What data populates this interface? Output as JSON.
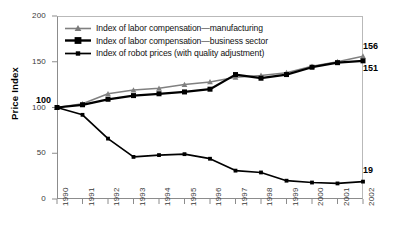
{
  "chart_data": {
    "type": "line",
    "title": "",
    "xlabel": "",
    "ylabel": "Price Index",
    "categories": [
      "1990",
      "1991",
      "1992",
      "1993",
      "1994",
      "1995",
      "1996",
      "1997",
      "1998",
      "1999",
      "2000",
      "2001",
      "2002"
    ],
    "ylim": [
      0,
      200
    ],
    "yticks": [
      0,
      50,
      100,
      150,
      200
    ],
    "grid": false,
    "legend_position": "top-left",
    "series": [
      {
        "name": "Index of labor compensation—manufacturing",
        "color": "#808080",
        "marker": "triangle",
        "values": [
          100,
          104,
          115,
          119,
          121,
          125,
          128,
          133,
          135,
          138,
          145,
          150,
          156
        ]
      },
      {
        "name": "Index of labor compensation—business sector",
        "color": "#000000",
        "marker": "square",
        "values": [
          100,
          103,
          109,
          113,
          115,
          117,
          120,
          136,
          132,
          136,
          144,
          149,
          151
        ]
      },
      {
        "name": "Index of robot prices (with quality adjustment)",
        "color": "#000000",
        "marker": "square-small",
        "values": [
          100,
          92,
          66,
          46,
          48,
          49,
          44,
          31,
          29,
          20,
          18,
          17,
          19
        ]
      }
    ],
    "annotations": [
      {
        "text": "100",
        "series": "manufacturing",
        "at": "1990"
      },
      {
        "text": "156",
        "series": "manufacturing",
        "at": "2002"
      },
      {
        "text": "151",
        "series": "business sector",
        "at": "2002"
      },
      {
        "text": "19",
        "series": "robot prices",
        "at": "2002"
      }
    ]
  },
  "axis": {
    "y": {
      "ticks": [
        {
          "label": "200"
        },
        {
          "label": "150"
        },
        {
          "label": "100"
        },
        {
          "label": "50"
        },
        {
          "label": "0"
        }
      ],
      "title": "Price Index"
    },
    "x": {
      "ticks": [
        {
          "label": "1990"
        },
        {
          "label": "1991"
        },
        {
          "label": "1992"
        },
        {
          "label": "1993"
        },
        {
          "label": "1994"
        },
        {
          "label": "1995"
        },
        {
          "label": "1996"
        },
        {
          "label": "1997"
        },
        {
          "label": "1998"
        },
        {
          "label": "1999"
        },
        {
          "label": "2000"
        },
        {
          "label": "2001"
        },
        {
          "label": "2002"
        }
      ]
    }
  },
  "legend": {
    "items": [
      {
        "label": "Index of labor compensation—manufacturing"
      },
      {
        "label": "Index of labor compensation—business sector"
      },
      {
        "label": "Index of robot prices (with quality adjustment)"
      }
    ]
  },
  "annotations": {
    "start": "100",
    "end_manufacturing": "156",
    "end_business": "151",
    "end_robot": "19"
  }
}
